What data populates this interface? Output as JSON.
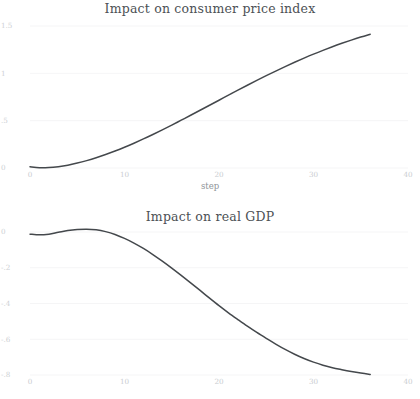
{
  "figure": {
    "background": "#ffffff",
    "line_color": "#44484c",
    "grid_color": "#f2f3f4",
    "tick_label_color": "#c9ccd0",
    "title_color": "#4c5155"
  },
  "panels": [
    {
      "id": "cpi",
      "title": "Impact on consumer price index",
      "xlabel": "step",
      "ylabel": ""
    },
    {
      "id": "gdp",
      "title": "Impact on real GDP",
      "xlabel": "",
      "ylabel": ""
    }
  ],
  "chart_data": [
    {
      "type": "line",
      "title": "Impact on consumer price index",
      "xlabel": "step",
      "ylabel": "",
      "xlim": [
        0,
        40
      ],
      "ylim": [
        0,
        1.5
      ],
      "xticks": [
        0,
        10,
        20,
        30,
        40
      ],
      "xticklabels": [
        "0",
        "10",
        "20",
        "30",
        "40"
      ],
      "yticks": [
        0,
        0.5,
        1,
        1.5
      ],
      "yticklabels": [
        "0",
        ".5",
        "1",
        "1.5"
      ],
      "grid": true,
      "legend": null,
      "series": [
        {
          "name": "cpi_irf",
          "x": [
            0,
            1,
            2,
            3,
            4,
            5,
            6,
            7,
            8,
            9,
            10,
            11,
            12,
            13,
            14,
            15,
            16,
            17,
            18,
            19,
            20,
            21,
            22,
            23,
            24,
            25,
            26,
            27,
            28,
            29,
            30,
            31,
            32,
            33,
            34,
            35,
            36
          ],
          "values": [
            0.012,
            0.002,
            0.004,
            0.014,
            0.03,
            0.052,
            0.078,
            0.108,
            0.142,
            0.179,
            0.219,
            0.262,
            0.307,
            0.354,
            0.403,
            0.453,
            0.505,
            0.557,
            0.61,
            0.663,
            0.716,
            0.769,
            0.822,
            0.874,
            0.925,
            0.975,
            1.024,
            1.071,
            1.117,
            1.161,
            1.203,
            1.243,
            1.281,
            1.317,
            1.351,
            1.383,
            1.413
          ]
        }
      ]
    },
    {
      "type": "line",
      "title": "Impact on real GDP",
      "xlabel": "",
      "ylabel": "",
      "xlim": [
        0,
        40
      ],
      "ylim": [
        -0.8,
        0.0
      ],
      "xticks": [
        0,
        10,
        20,
        30,
        40
      ],
      "xticklabels": [
        "0",
        "10",
        "20",
        "30",
        "40"
      ],
      "yticks": [
        0,
        -0.2,
        -0.4,
        -0.6,
        -0.8
      ],
      "yticklabels": [
        "0",
        "-.2",
        "-.4",
        "-.6",
        "-.8"
      ],
      "grid": true,
      "legend": null,
      "series": [
        {
          "name": "gdp_irf",
          "x": [
            0,
            1,
            2,
            3,
            4,
            5,
            6,
            7,
            8,
            9,
            10,
            11,
            12,
            13,
            14,
            15,
            16,
            17,
            18,
            19,
            20,
            21,
            22,
            23,
            24,
            25,
            26,
            27,
            28,
            29,
            30,
            31,
            32,
            33,
            34,
            35,
            36
          ],
          "values": [
            -0.012,
            -0.016,
            -0.012,
            -0.002,
            0.008,
            0.014,
            0.016,
            0.012,
            0.002,
            -0.014,
            -0.036,
            -0.062,
            -0.092,
            -0.126,
            -0.163,
            -0.202,
            -0.243,
            -0.285,
            -0.327,
            -0.37,
            -0.412,
            -0.452,
            -0.49,
            -0.527,
            -0.562,
            -0.595,
            -0.627,
            -0.657,
            -0.684,
            -0.708,
            -0.728,
            -0.745,
            -0.759,
            -0.77,
            -0.78,
            -0.789,
            -0.797
          ]
        }
      ]
    }
  ]
}
